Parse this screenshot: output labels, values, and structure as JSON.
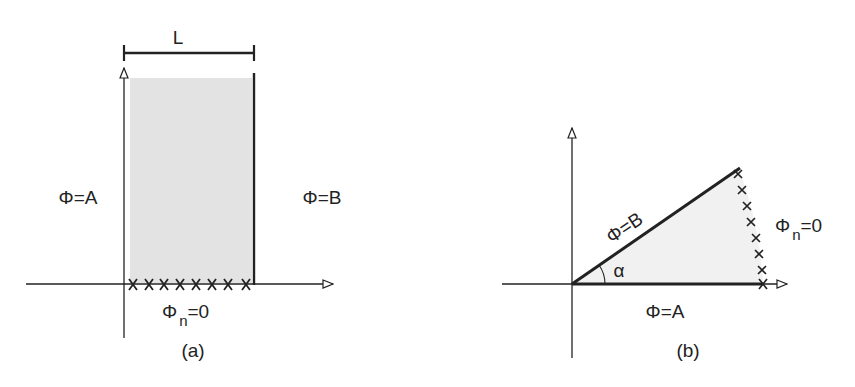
{
  "figure": {
    "panels": [
      {
        "id": "a",
        "caption": "(a)",
        "dimension_label": "L",
        "left_boundary_label": "Φ=A",
        "right_boundary_label": "Φ=B",
        "bottom_boundary_label": {
          "symbol": "Φ",
          "subscript": "n",
          "rest": "=0"
        },
        "shape": "rectangle",
        "crosses_count": 8
      },
      {
        "id": "b",
        "caption": "(b)",
        "upper_edge_label": "Φ=B",
        "lower_edge_label": "Φ=A",
        "angle_label": "α",
        "arc_boundary_label": {
          "symbol": "Φ",
          "subscript": "n",
          "rest": "=0"
        },
        "shape": "wedge",
        "crosses_count": 7
      }
    ],
    "colors": {
      "stroke": "#222222",
      "fill_a": "#e3e3e3",
      "fill_b": "#f1f1f1"
    }
  }
}
